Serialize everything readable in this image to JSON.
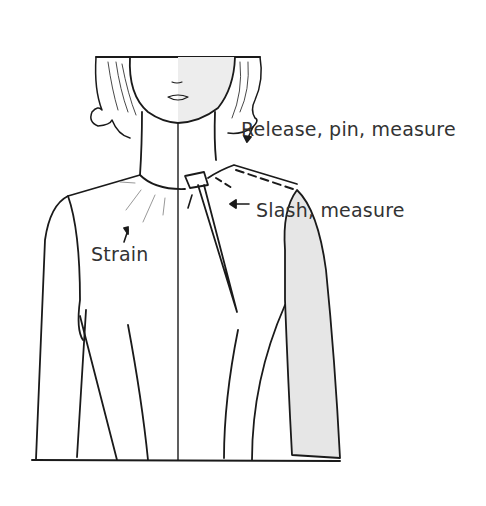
{
  "diagram": {
    "labels": {
      "release": "Release, pin, measure",
      "slash": "Slash, measure",
      "strain": "Strain"
    },
    "colors": {
      "line": "#1a1a1a",
      "shade": "#e6e6e6",
      "text": "#333333"
    }
  }
}
